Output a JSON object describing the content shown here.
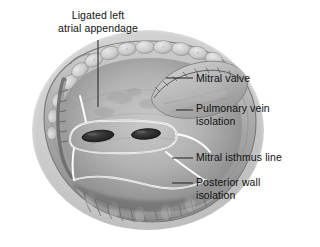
{
  "figure": {
    "width": 320,
    "height": 247,
    "palette": {
      "background": "#ffffff",
      "text": "#111111",
      "leader_line": "#1a1a1a",
      "ablation_line": "#ffffff",
      "tissue_light": "#d8d8d8",
      "tissue_mid": "#a8a8a8",
      "tissue_dark": "#6e6e6e",
      "ostium_dark": "#2b2b2b"
    }
  },
  "labels": {
    "ligated_appendage": "Ligated left\natrial appendage",
    "mitral_valve": "Mitral valve",
    "pulmonary_vein_isolation": "Pulmonary vein\nisolation",
    "mitral_isthmus_line": "Mitral isthmus line",
    "posterior_wall_isolation": "Posterior wall\nisolation"
  },
  "anatomy": {
    "left_atrium": "left-atrium-chamber",
    "mitral_valve_leaflet": "mitral-valve-leaflet",
    "pulmonary_vein_ostium_left": "pulmonary-vein-ostium-left",
    "pulmonary_vein_ostium_right": "pulmonary-vein-ostium-right",
    "ligated_appendage_ridge": "ligated-appendage-ridge",
    "epicardial_fat": "epicardial-fat-lobules",
    "pectinate_muscles": "pectinate-muscle-ridges",
    "atrial_wall_rim": "atrial-wall-rim"
  },
  "ablation_lines": {
    "pv_isolation_encircling": "pv-isolation-encircling-lesion",
    "mitral_isthmus": "mitral-isthmus-lesion-line",
    "posterior_wall_box": "posterior-wall-box-lesion",
    "roof_line": "roof-lesion-line"
  }
}
